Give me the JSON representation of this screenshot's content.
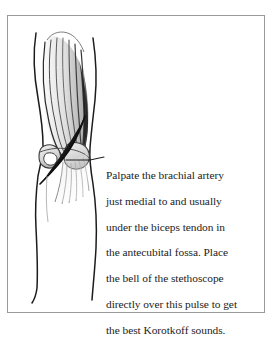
{
  "figure": {
    "type": "medical-illustration",
    "background_color": "#ffffff",
    "border_color": "#9a9a9a",
    "ink_color": "#1c1c1c"
  },
  "annotation": {
    "label": "Palpate the brachial artery just medial to and usually under the biceps tendon in the antecubital fossa. Place the bell of the stethoscope directly over this pulse to get the best Korotkoff sounds.",
    "lines": [
      "Palpate the brachial artery",
      "just medial to and usually",
      "under the biceps tendon in",
      "the antecubital fossa. Place",
      "the bell of the stethoscope",
      "directly over this pulse to get",
      "the best Korotkoff sounds."
    ],
    "leader_line_color": "#1c1c1c"
  },
  "anatomy": {
    "parts": [
      "biceps brachii muscle",
      "biceps tendon",
      "antecubital fossa",
      "brachial artery",
      "forearm",
      "elbow"
    ]
  }
}
